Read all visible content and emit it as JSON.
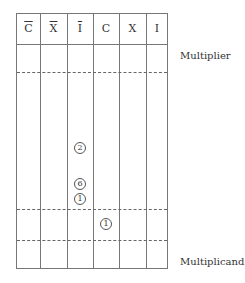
{
  "headers": [
    {
      "symbol": "C",
      "bar": true
    },
    {
      "symbol": "X",
      "bar": true
    },
    {
      "symbol": "I",
      "bar": true
    },
    {
      "symbol": "C",
      "bar": false
    },
    {
      "symbol": "X",
      "bar": false
    },
    {
      "symbol": "I",
      "bar": false
    }
  ],
  "labels": {
    "multiplier": "Multiplier",
    "multiplicand": "Multiplicand"
  },
  "markers": [
    {
      "value": "2",
      "column": "I-bar"
    },
    {
      "value": "6",
      "column": "I-bar"
    },
    {
      "value": "1",
      "column": "I-bar"
    },
    {
      "value": "1",
      "column": "C"
    }
  ]
}
